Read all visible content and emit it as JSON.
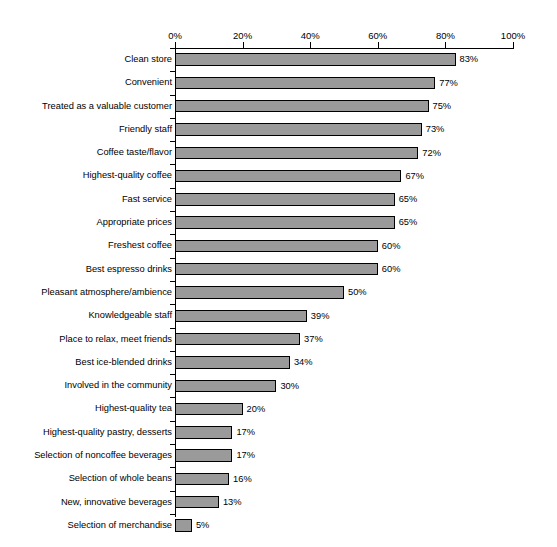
{
  "top_artifact_text": "",
  "chart_data": {
    "type": "bar",
    "orientation": "horizontal",
    "title": "",
    "subtitle": "",
    "xlabel": "",
    "ylabel": "",
    "xlim": [
      0,
      100
    ],
    "grid": false,
    "legend": null,
    "tick_labels": [
      "0%",
      "20%",
      "40%",
      "60%",
      "80%",
      "100%"
    ],
    "tick_values": [
      0,
      20,
      40,
      60,
      80,
      100
    ],
    "value_suffix": "%",
    "bar_color": "#9a9a9a",
    "bar_edge_color": "#000000",
    "categories": [
      "Clean store",
      "Convenient",
      "Treated as a valuable customer",
      "Friendly staff",
      "Coffee taste/flavor",
      "Highest-quality coffee",
      "Fast service",
      "Appropriate prices",
      "Freshest coffee",
      "Best espresso drinks",
      "Pleasant atmosphere/ambience",
      "Knowledgeable staff",
      "Place to relax, meet friends",
      "Best ice-blended drinks",
      "Involved in the community",
      "Highest-quality tea",
      "Highest-quality pastry, desserts",
      "Selection of noncoffee beverages",
      "Selection of whole beans",
      "New, innovative beverages",
      "Selection of merchandise"
    ],
    "values": [
      83,
      77,
      75,
      73,
      72,
      67,
      65,
      65,
      60,
      60,
      50,
      39,
      37,
      34,
      30,
      20,
      17,
      17,
      16,
      13,
      5
    ],
    "value_labels": [
      "83%",
      "77%",
      "75%",
      "73%",
      "72%",
      "67%",
      "65%",
      "65%",
      "60%",
      "60%",
      "50%",
      "39%",
      "37%",
      "34%",
      "30%",
      "20%",
      "17%",
      "17%",
      "16%",
      "13%",
      "5%"
    ]
  }
}
